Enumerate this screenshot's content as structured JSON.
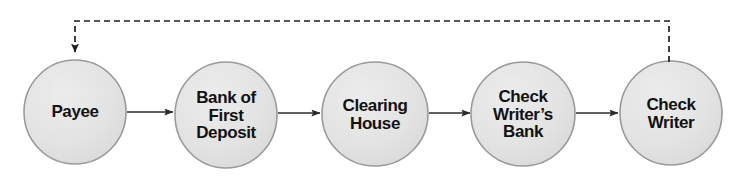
{
  "diagram": {
    "background_color": "#ffffff",
    "node_fill_color": "#e4e4e4",
    "node_stroke_color": "#9a9a9a",
    "connector_color": "#2b2b2b",
    "feedback_line_color": "#1e1e1e",
    "text_color": "#121212",
    "nodes": [
      {
        "id": "payee",
        "label": "Payee",
        "cx": 75,
        "cy": 112,
        "rx": 51,
        "ry": 52
      },
      {
        "id": "bank-first-deposit",
        "label": "Bank of\nFirst\nDeposit",
        "cx": 226,
        "cy": 115,
        "rx": 51,
        "ry": 53
      },
      {
        "id": "clearing-house",
        "label": "Clearing\nHouse",
        "cx": 375,
        "cy": 114,
        "rx": 53,
        "ry": 52
      },
      {
        "id": "check-writers-bank",
        "label": "Check\nWriter’s\nBank",
        "cx": 523,
        "cy": 114,
        "rx": 52,
        "ry": 52
      },
      {
        "id": "check-writer",
        "label": "Check\nWriter",
        "cx": 671,
        "cy": 113,
        "rx": 51,
        "ry": 52
      }
    ],
    "connectors": [
      {
        "id": "payee-to-bank-first-deposit",
        "from": "payee",
        "to": "bank-first-deposit",
        "style": "solid",
        "arrow": "forward",
        "x1": 127,
        "x2": 173,
        "y": 112
      },
      {
        "id": "bank-first-deposit-to-clearing-house",
        "from": "bank-first-deposit",
        "to": "clearing-house",
        "style": "solid",
        "arrow": "forward",
        "x1": 278,
        "x2": 320,
        "y": 113
      },
      {
        "id": "clearing-house-to-check-writers-bank",
        "from": "clearing-house",
        "to": "check-writers-bank",
        "style": "solid",
        "arrow": "forward",
        "x1": 429,
        "x2": 470,
        "y": 113
      },
      {
        "id": "check-writers-bank-to-check-writer",
        "from": "check-writers-bank",
        "to": "check-writer",
        "style": "solid",
        "arrow": "forward",
        "x1": 576,
        "x2": 618,
        "y": 113
      }
    ],
    "feedback_connector": {
      "id": "check-writer-to-payee-feedback",
      "from": "check-writer",
      "to": "payee",
      "style": "dashed",
      "arrow": "forward",
      "dash_length": 6,
      "gap_length": 4,
      "path": "M 669 62 L 669 21 L 75 21 L 75 52"
    }
  }
}
